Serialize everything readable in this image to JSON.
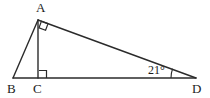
{
  "figure": {
    "kind": "geometry-diagram",
    "background_color": "#ffffff",
    "stroke_color": "#2b2b2b",
    "text_color": "#1b1b1b"
  },
  "labels": {
    "vertex_a": "A",
    "vertex_b": "B",
    "vertex_c": "C",
    "vertex_d": "D",
    "angle_d": "21°"
  },
  "geometry": {
    "points": {
      "A": {
        "x": 38,
        "y": 20
      },
      "B": {
        "x": 13,
        "y": 78
      },
      "C": {
        "x": 38,
        "y": 78
      },
      "D": {
        "x": 196,
        "y": 78
      }
    },
    "segments": [
      {
        "name": "AB",
        "from": "A",
        "to": "B"
      },
      {
        "name": "AC",
        "from": "A",
        "to": "C"
      },
      {
        "name": "AD",
        "from": "A",
        "to": "D"
      },
      {
        "name": "BD",
        "from": "B",
        "to": "D"
      }
    ],
    "right_angles": [
      {
        "name": "angle-BAD",
        "at": "A"
      },
      {
        "name": "angle-ACD",
        "at": "C"
      }
    ],
    "marked_angles": [
      {
        "name": "angle-ADC",
        "at": "D",
        "value": "21°"
      }
    ]
  }
}
